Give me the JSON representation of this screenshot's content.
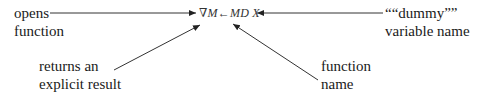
{
  "diagram": {
    "code_line": "∇M←MD  X",
    "labels": {
      "opens_function": [
        "opens",
        "function"
      ],
      "dummy_variable": [
        "““dummy””",
        "variable name"
      ],
      "returns_result": [
        "returns an",
        "explicit result"
      ],
      "function_name": [
        "function",
        "name"
      ]
    },
    "arrows": [
      {
        "from": "opens_function",
        "to": "∇"
      },
      {
        "from": "dummy_variable",
        "to": "X"
      },
      {
        "from": "returns_result",
        "to": "M"
      },
      {
        "from": "function_name",
        "to": "MD"
      }
    ]
  }
}
